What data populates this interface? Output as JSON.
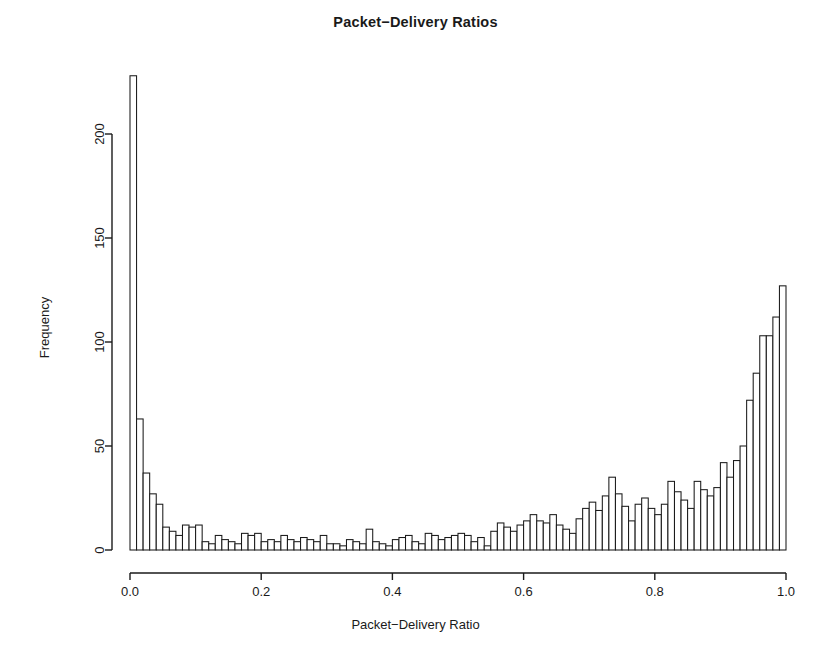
{
  "chart_data": {
    "type": "bar",
    "title": "Packet−Delivery Ratios",
    "xlabel": "Packet−Delivery Ratio",
    "ylabel": "Frequency",
    "xlim": [
      0.0,
      1.0
    ],
    "ylim": [
      0,
      200
    ],
    "xticks": [
      0.0,
      0.2,
      0.4,
      0.6,
      0.8,
      1.0
    ],
    "xtick_labels": [
      "0.0",
      "0.2",
      "0.4",
      "0.6",
      "0.8",
      "1.0"
    ],
    "yticks": [
      0,
      50,
      100,
      150,
      200
    ],
    "ytick_labels": [
      "0",
      "50",
      "100",
      "150",
      "200"
    ],
    "grid": false,
    "legend": null,
    "bin_width": 0.01,
    "bin_count": 100,
    "bar_fill": "#ffffff",
    "bar_edge": "#1a1a1a",
    "axis_color": "#1a1a1a",
    "bin_starts": [
      0.0,
      0.01,
      0.02,
      0.03,
      0.04,
      0.05,
      0.06,
      0.07,
      0.08,
      0.09,
      0.1,
      0.11,
      0.12,
      0.13,
      0.14,
      0.15,
      0.16,
      0.17,
      0.18,
      0.19,
      0.2,
      0.21,
      0.22,
      0.23,
      0.24,
      0.25,
      0.26,
      0.27,
      0.28,
      0.29,
      0.3,
      0.31,
      0.32,
      0.33,
      0.34,
      0.35,
      0.36,
      0.37,
      0.38,
      0.39,
      0.4,
      0.41,
      0.42,
      0.43,
      0.44,
      0.45,
      0.46,
      0.47,
      0.48,
      0.49,
      0.5,
      0.51,
      0.52,
      0.53,
      0.54,
      0.55,
      0.56,
      0.57,
      0.58,
      0.59,
      0.6,
      0.61,
      0.62,
      0.63,
      0.64,
      0.65,
      0.66,
      0.67,
      0.68,
      0.69,
      0.7,
      0.71,
      0.72,
      0.73,
      0.74,
      0.75,
      0.76,
      0.77,
      0.78,
      0.79,
      0.8,
      0.81,
      0.82,
      0.83,
      0.84,
      0.85,
      0.86,
      0.87,
      0.88,
      0.89,
      0.9,
      0.91,
      0.92,
      0.93,
      0.94,
      0.95,
      0.96,
      0.97,
      0.98,
      0.99
    ],
    "values": [
      228,
      63,
      37,
      27,
      22,
      11,
      9,
      7,
      12,
      11,
      12,
      4,
      3,
      7,
      5,
      4,
      3,
      8,
      7,
      8,
      4,
      5,
      4,
      7,
      5,
      4,
      6,
      5,
      4,
      7,
      3,
      3,
      2,
      5,
      4,
      3,
      10,
      4,
      3,
      2,
      5,
      6,
      7,
      4,
      3,
      8,
      7,
      5,
      6,
      7,
      8,
      7,
      4,
      6,
      2,
      9,
      13,
      11,
      9,
      12,
      14,
      17,
      14,
      13,
      17,
      12,
      10,
      8,
      15,
      20,
      23,
      19,
      26,
      35,
      27,
      21,
      14,
      22,
      25,
      20,
      17,
      22,
      33,
      28,
      24,
      20,
      33,
      29,
      26,
      30,
      42,
      35,
      43,
      50,
      72,
      85,
      103,
      103,
      112,
      127
    ]
  }
}
